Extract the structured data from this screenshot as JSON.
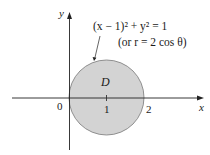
{
  "figure": {
    "axes": {
      "x_label": "x",
      "y_label": "y",
      "origin_label": "0",
      "ticks": [
        {
          "value": 1,
          "label": "1"
        },
        {
          "value": 2,
          "label": "2"
        }
      ]
    },
    "region": {
      "label": "D",
      "fill": "#d3d3d3",
      "stroke": "#777777"
    },
    "equation": {
      "line1": "(x − 1)² + y² = 1",
      "line2": "(or  r = 2 cos θ)"
    }
  }
}
